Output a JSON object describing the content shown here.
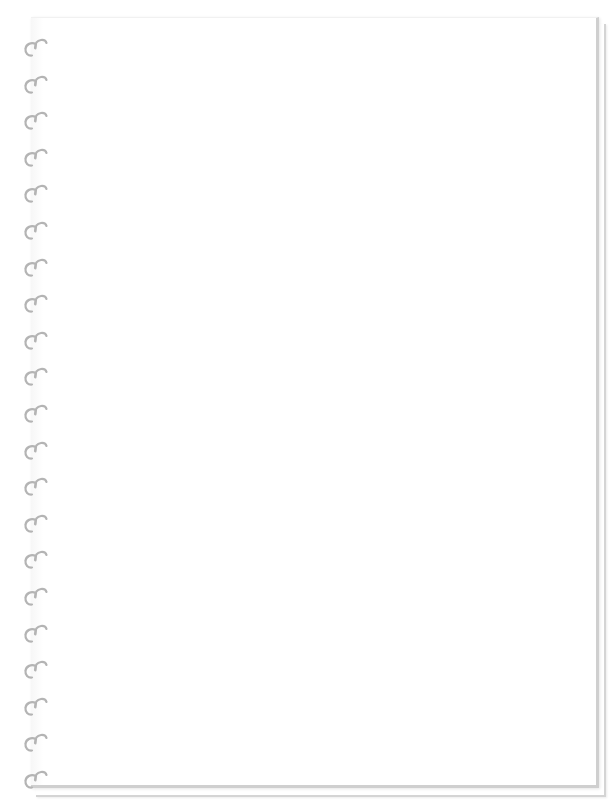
{
  "notebook": {
    "type": "spiral-bound blank page",
    "page_color": "#ffffff",
    "edge_color": "#cfcfcf",
    "ring_color": "#b4b4b4",
    "ring_count": 21,
    "ring_first_y": 36,
    "ring_spacing": 36.6,
    "sheets": 2
  }
}
